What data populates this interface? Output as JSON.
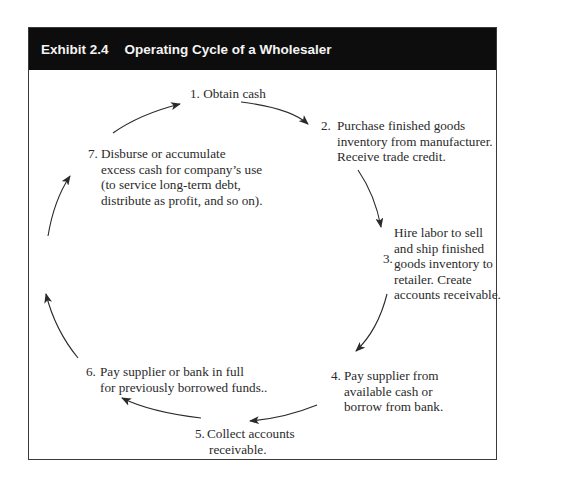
{
  "exhibit": {
    "label": "Exhibit 2.4",
    "title": "Operating Cycle of a Wholesaler"
  },
  "steps": [
    {
      "number": "1.",
      "lines": [
        "Obtain cash"
      ]
    },
    {
      "number": "2.",
      "lines": [
        "Purchase finished goods",
        "inventory from manufacturer.",
        "Receive trade credit."
      ]
    },
    {
      "number": "3.",
      "lines": [
        "Hire labor to sell",
        "and ship finished",
        "goods inventory to",
        "retailer. Create",
        "accounts receivable."
      ]
    },
    {
      "number": "4.",
      "lines": [
        "Pay supplier from",
        "available cash or",
        "borrow from bank."
      ]
    },
    {
      "number": "5.",
      "lines": [
        "Collect accounts",
        "receivable."
      ]
    },
    {
      "number": "6.",
      "lines": [
        "Pay supplier or bank in full",
        "for previously borrowed funds.."
      ]
    },
    {
      "number": "7.",
      "lines": [
        "Disburse or accumulate",
        "excess cash for company’s use",
        "(to service long-term debt,",
        "distribute as profit, and so on)."
      ]
    }
  ],
  "colors": {
    "header_bg": "#0d0d0d",
    "header_text": "#f4f4f4",
    "text": "#2a2a2a",
    "arrow": "#2a2a2a",
    "border": "#3a3a3a"
  },
  "arrows": [
    {
      "name": "arrow-1-to-2",
      "from": "step-1",
      "to": "step-2"
    },
    {
      "name": "arrow-2-to-3",
      "from": "step-2",
      "to": "step-3"
    },
    {
      "name": "arrow-3-to-4",
      "from": "step-3",
      "to": "step-4"
    },
    {
      "name": "arrow-4-to-5",
      "from": "step-4",
      "to": "step-5"
    },
    {
      "name": "arrow-5-to-6",
      "from": "step-5",
      "to": "step-6"
    },
    {
      "name": "arrow-6-up",
      "from": "step-6",
      "to": "step-7"
    },
    {
      "name": "arrow-7-to-1",
      "from": "step-7",
      "to": "step-1"
    }
  ]
}
